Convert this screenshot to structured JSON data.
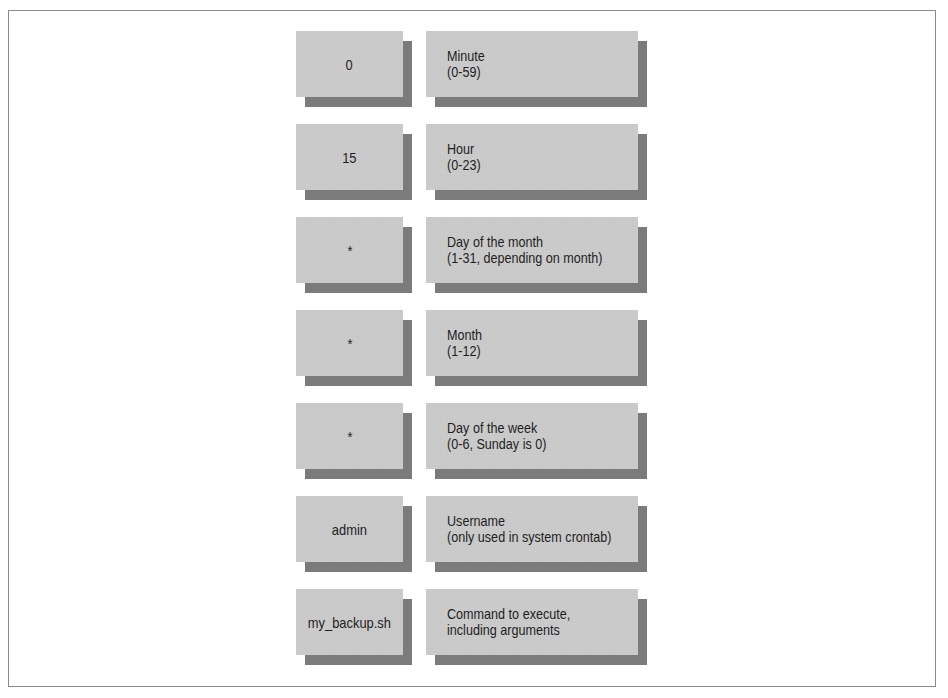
{
  "diagram": {
    "title": "",
    "fields": [
      {
        "value": "0",
        "name": "Minute",
        "range": "(0-59)"
      },
      {
        "value": "15",
        "name": "Hour",
        "range": "(0-23)"
      },
      {
        "value": "*",
        "name": "Day of the month",
        "range": "(1-31, depending on month)"
      },
      {
        "value": "*",
        "name": "Month",
        "range": "(1-12)"
      },
      {
        "value": "*",
        "name": "Day of the week",
        "range": "(0-6, Sunday is 0)"
      },
      {
        "value": "admin",
        "name": "Username",
        "range": "(only used in system crontab)"
      },
      {
        "value": "my_backup.sh",
        "name": "Command to execute,",
        "range": "including arguments"
      }
    ]
  },
  "colors": {
    "box_fill": "#c9c9c9",
    "box_shadow": "#7b7b7b",
    "frame_border": "#8a8a8a",
    "text": "#1e1e1e"
  }
}
